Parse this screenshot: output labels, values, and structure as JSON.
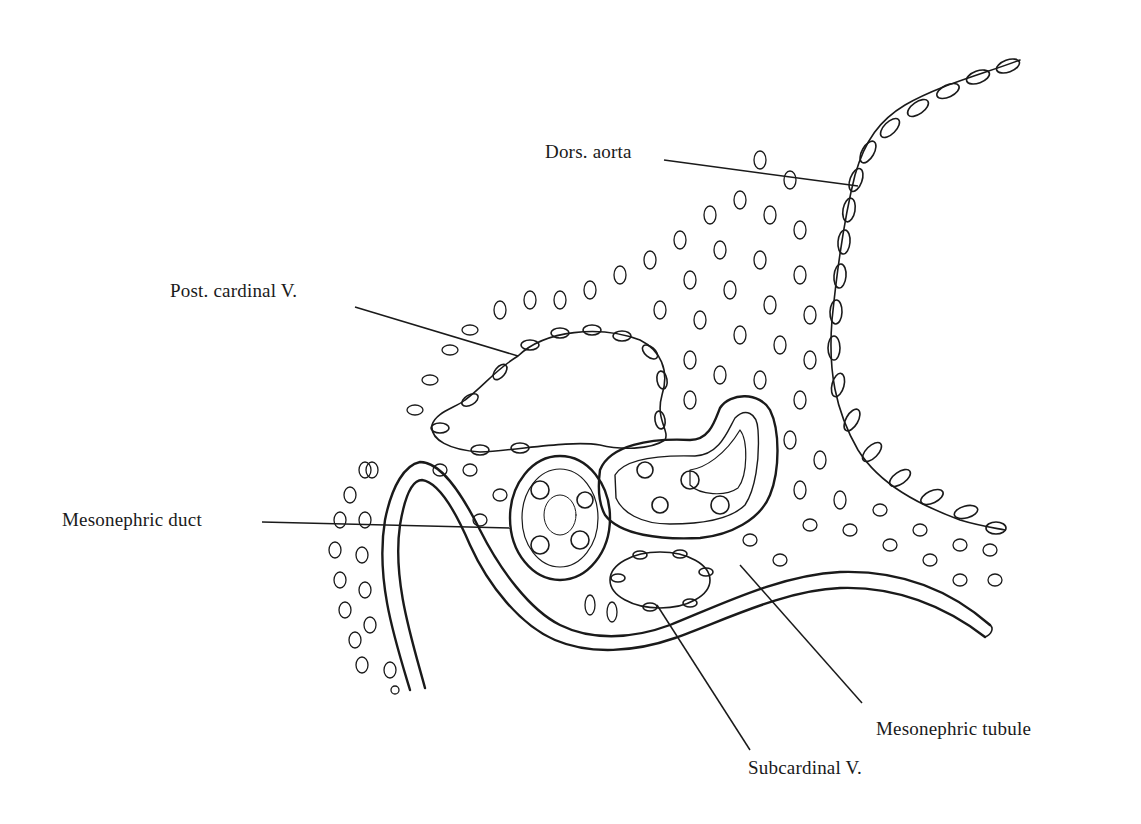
{
  "figure": {
    "background": "#ffffff",
    "ink": "#1a1a1a",
    "labels": [
      {
        "id": "dors-aorta",
        "text": "Dors. aorta",
        "x": 545,
        "y": 152,
        "line": [
          664,
          160,
          858,
          186
        ]
      },
      {
        "id": "post-cardinal-v",
        "text": "Post. cardinal V.",
        "x": 170,
        "y": 285,
        "line": [
          355,
          307,
          518,
          356
        ]
      },
      {
        "id": "mesonephric-duct",
        "text": "Mesonephric duct",
        "x": 62,
        "y": 505,
        "line": [
          262,
          522,
          510,
          528
        ]
      },
      {
        "id": "mesonephric-tubule",
        "text": "Mesonephric tubule",
        "x": 876,
        "y": 722,
        "line": [
          862,
          703,
          740,
          565
        ]
      },
      {
        "id": "subcardinal-v",
        "text": "Subcardinal V.",
        "x": 748,
        "y": 766,
        "line": [
          750,
          750,
          657,
          605
        ]
      }
    ]
  }
}
